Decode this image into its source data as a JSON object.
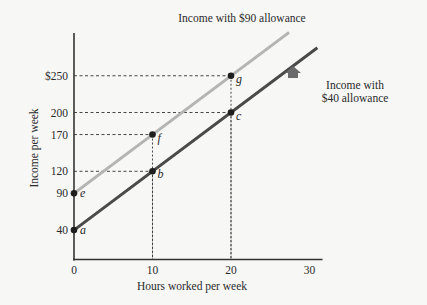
{
  "chart_data": {
    "type": "line",
    "title": "",
    "xlabel": "Hours worked per week",
    "ylabel": "Income per week",
    "xlim": [
      0,
      30
    ],
    "ylim": [
      0,
      300
    ],
    "grid": false,
    "x_ticks": [
      {
        "value": 0,
        "label": "0"
      },
      {
        "value": 10,
        "label": "10"
      },
      {
        "value": 20,
        "label": "20"
      },
      {
        "value": 30,
        "label": "30"
      }
    ],
    "y_ticks": [
      {
        "value": 40,
        "label": "40"
      },
      {
        "value": 90,
        "label": "90"
      },
      {
        "value": 120,
        "label": "120"
      },
      {
        "value": 170,
        "label": "170"
      },
      {
        "value": 200,
        "label": "200"
      },
      {
        "value": 250,
        "label": "$250"
      }
    ],
    "series": [
      {
        "name": "Income with $40 allowance",
        "label_lines": [
          "Income with",
          "$40 allowance"
        ],
        "color": "#4a4a4a",
        "x": [
          0,
          10,
          20
        ],
        "y": [
          40,
          120,
          200
        ],
        "line_extends_to": {
          "x": 31,
          "y": 288
        },
        "points": [
          {
            "label": "a",
            "x": 0,
            "y": 40
          },
          {
            "label": "b",
            "x": 10,
            "y": 120
          },
          {
            "label": "c",
            "x": 20,
            "y": 200
          }
        ]
      },
      {
        "name": "Income with $90 allowance",
        "label_lines": [
          "Income with $90 allowance"
        ],
        "color": "#b4b4b4",
        "x": [
          0,
          10,
          20
        ],
        "y": [
          90,
          170,
          250
        ],
        "line_extends_to": {
          "x": 27.4,
          "y": 309
        },
        "points": [
          {
            "label": "e",
            "x": 0,
            "y": 90
          },
          {
            "label": "f",
            "x": 10,
            "y": 170
          },
          {
            "label": "g",
            "x": 20,
            "y": 250
          }
        ]
      }
    ],
    "annotations": [
      {
        "type": "arrow",
        "direction": "up",
        "note": "upward shift from $40 to $90 allowance line",
        "x": 27.9,
        "y": 252
      }
    ],
    "legend": "inline labels"
  }
}
